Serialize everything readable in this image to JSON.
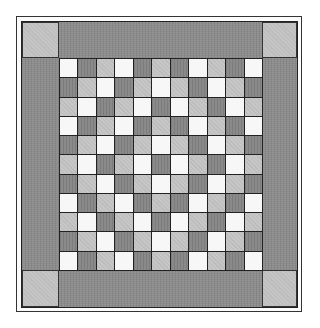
{
  "figure": {
    "type": "quilt-pattern",
    "grid_size": {
      "rows": 11,
      "cols": 11
    },
    "tones": {
      "D": {
        "name": "dark",
        "color": "#8a8a8a"
      },
      "L": {
        "name": "light",
        "color": "#c6c6c6"
      },
      "W": {
        "name": "white",
        "color": "#f7f7f7"
      }
    },
    "border_color": "#8c8c8c",
    "corner_color": "#c4c4c4",
    "line_color": "#222222",
    "rows": [
      [
        "W",
        "D",
        "L",
        "W",
        "D",
        "L",
        "D",
        "W",
        "L",
        "D",
        "W"
      ],
      [
        "D",
        "L",
        "W",
        "D",
        "L",
        "W",
        "L",
        "D",
        "W",
        "L",
        "D"
      ],
      [
        "L",
        "W",
        "D",
        "L",
        "W",
        "D",
        "W",
        "L",
        "D",
        "W",
        "L"
      ],
      [
        "W",
        "D",
        "L",
        "W",
        "D",
        "L",
        "D",
        "W",
        "L",
        "D",
        "W"
      ],
      [
        "D",
        "L",
        "W",
        "D",
        "L",
        "W",
        "L",
        "D",
        "W",
        "L",
        "D"
      ],
      [
        "L",
        "W",
        "D",
        "L",
        "W",
        "D",
        "W",
        "L",
        "D",
        "W",
        "L"
      ],
      [
        "D",
        "L",
        "W",
        "D",
        "L",
        "W",
        "L",
        "D",
        "W",
        "L",
        "D"
      ],
      [
        "W",
        "D",
        "L",
        "W",
        "D",
        "L",
        "D",
        "W",
        "L",
        "D",
        "W"
      ],
      [
        "L",
        "W",
        "D",
        "L",
        "W",
        "D",
        "W",
        "L",
        "D",
        "W",
        "L"
      ],
      [
        "D",
        "L",
        "W",
        "D",
        "L",
        "W",
        "L",
        "D",
        "W",
        "L",
        "D"
      ],
      [
        "W",
        "D",
        "L",
        "W",
        "D",
        "L",
        "D",
        "W",
        "L",
        "D",
        "W"
      ]
    ],
    "corners": [
      "top-left",
      "top-right",
      "bottom-left",
      "bottom-right"
    ]
  }
}
